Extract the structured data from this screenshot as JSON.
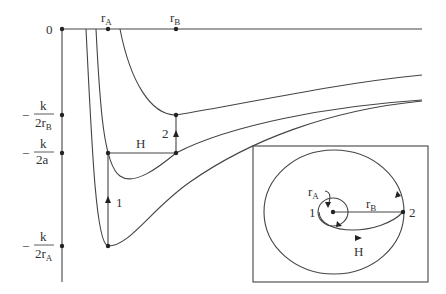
{
  "diagram": {
    "title": "",
    "axis": {
      "zero_label": "0",
      "top_labels": {
        "rA": "r",
        "rA_sub": "A",
        "rB": "r",
        "rB_sub": "B"
      },
      "y_ticks": [
        {
          "minus": "−",
          "num": "k",
          "den": "2r",
          "den_sub": "B"
        },
        {
          "minus": "−",
          "num": "k",
          "den": "2a",
          "den_sub": ""
        },
        {
          "minus": "−",
          "num": "k",
          "den": "2r",
          "den_sub": "A"
        }
      ]
    },
    "energy_diagram": {
      "transfer_label": "H",
      "burn1_label": "1",
      "burn2_label": "2"
    },
    "inset": {
      "rA_label": "r",
      "rA_sub": "A",
      "rB_label": "r",
      "rB_sub": "B",
      "point1_label": "1",
      "point2_label": "2",
      "transfer_label": "H"
    },
    "colors": {
      "line": "#444444",
      "background": "#ffffff",
      "text": "#333333"
    }
  }
}
